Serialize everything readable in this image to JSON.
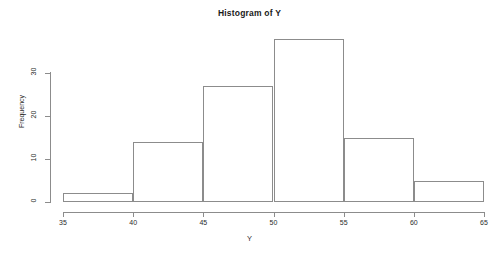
{
  "chart_data": {
    "type": "bar",
    "title": "Histogram of Y",
    "xlabel": "Y",
    "ylabel": "Frequency",
    "categories": [
      "35-40",
      "40-45",
      "45-50",
      "50-55",
      "55-60",
      "60-65"
    ],
    "bin_edges": [
      35,
      40,
      45,
      50,
      55,
      60,
      65
    ],
    "values": [
      2,
      14,
      27,
      38,
      15,
      5
    ],
    "x": [
      37.5,
      42.5,
      47.5,
      52.5,
      57.5,
      62.5
    ],
    "xlim": [
      35,
      65
    ],
    "ylim": [
      0,
      40
    ],
    "x_ticks": [
      35,
      40,
      45,
      50,
      55,
      60,
      65
    ],
    "x_tick_labels": [
      "35",
      "40",
      "45",
      "50",
      "55",
      "60",
      "65"
    ],
    "y_ticks": [
      0,
      10,
      20,
      30
    ],
    "y_tick_labels": [
      "0",
      "10",
      "20",
      "30"
    ],
    "grid": false,
    "legend": false,
    "bar_fill": "transparent",
    "bar_border": "#8c8c8c",
    "axis_color": "#8c8c8c",
    "background": "#ffffff"
  }
}
